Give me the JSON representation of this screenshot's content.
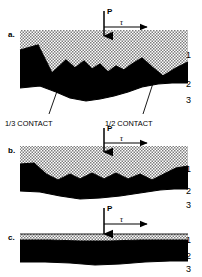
{
  "figure": {
    "panels": [
      {
        "letter": "a.",
        "load_label": "P",
        "shear_label": "τ",
        "layer_labels": [
          "1",
          "2",
          "3"
        ],
        "interface": "rough-asperity",
        "profile_top": "M 20,50 L 38,45 L 52,73 L 66,60 L 75,68 L 84,61 L 92,69 L 100,64 L 108,72 L 116,66 L 124,70 L 132,64 L 142,58 L 152,67 L 163,76 L 176,68 L 188,62",
        "profile_bottom": "M 20,88 L 40,86 L 56,92 L 70,98 L 86,101 L 100,99 L 114,96 L 128,92 L 142,87 L 158,84 L 172,83 L 188,83"
      },
      {
        "letter": "b.",
        "load_label": "P",
        "shear_label": "τ",
        "layer_labels": [
          "1",
          "2",
          "3"
        ],
        "interface": "wavy-smooth",
        "profile_top": "M 20,164 L 34,163 L 46,174 L 58,180 L 70,174 L 80,179 L 92,173 L 104,179 L 116,173 L 128,179 L 140,174 L 152,180 L 164,174 L 176,168 L 188,166",
        "profile_bottom": "M 20,191 L 40,192 L 60,196 L 80,199 L 100,198 L 120,196 L 140,193 L 160,190 L 174,189 L 188,189"
      },
      {
        "letter": "c.",
        "load_label": "P",
        "shear_label": "τ",
        "layer_labels": [
          "1",
          "2",
          "3"
        ],
        "interface": "nearly-flat",
        "profile_top": "M 20,240 L 50,240 L 80,241 L 110,241 L 140,240 L 170,240 L 188,240",
        "profile_bottom": "M 20,262 L 45,262 L 70,263 L 95,265 L 120,264 L 145,262 L 170,261 L 188,261"
      }
    ],
    "annotations": [
      {
        "text": "1/3 CONTACT",
        "leader_from_x": 62,
        "leader_from_y": 108,
        "leader_to_x": 48,
        "leader_to_y": 120
      },
      {
        "text": "1/2 CONTACT",
        "leader_from_x": 155,
        "leader_from_y": 108,
        "leader_to_x": 142,
        "leader_to_y": 120
      }
    ],
    "colors": {
      "hatch_layer": "#b3b3b3",
      "solid_layer": "#000000",
      "base_layer": "#ffffff",
      "stroke": "#000000",
      "background": "#ffffff"
    }
  }
}
